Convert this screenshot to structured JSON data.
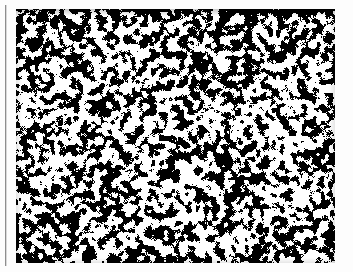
{
  "page": {
    "width": 353,
    "height": 272,
    "background_color": "#fdfdfd",
    "description": "Scanned page fragment showing a single full-bleed bilevel halftone image plate with a thin vertical rule at the left edge. No captions, labels, axes or interface controls are visible."
  },
  "left_rule": {
    "name": "vertical-rule",
    "color": "#8e8e8e",
    "shadow_color": "#d8d8d8",
    "x": 5,
    "y": 5,
    "thickness": 1,
    "length": 261
  },
  "plate": {
    "name": "halftone-image-plate",
    "x": 16,
    "y": 9,
    "width": 319,
    "height": 254,
    "ink_color": "#000000",
    "paper_color": "#ffffff",
    "alt_text": "Dense granular black and white halftone texture resembling a high magnification micrograph of a porous or speckled surface.",
    "texture": {
      "type": "bilevel-halftone-noise",
      "ink_coverage_percent": 47,
      "blob_size_min_px": 1,
      "blob_size_max_px": 4,
      "smoothing_passes": 2,
      "threshold": 0.5,
      "seed": 20240917,
      "noise_scale": 1.55,
      "edge_density_boost_percent": 12,
      "top_band_height_px": 6,
      "top_band_ink_coverage_percent": 62
    }
  },
  "vignette": {
    "name": "plate-edge-vignette",
    "top_strength": 0.22,
    "side_strength": 0.1,
    "bottom_strength": 0.1
  }
}
